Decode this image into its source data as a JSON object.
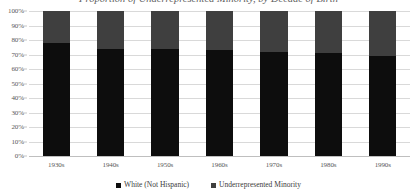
{
  "chart_data": {
    "type": "bar",
    "subtype": "stacked-100-percent",
    "title": "Proportion of Underrepresented Minority, by Decade of Birth",
    "title_visible": false,
    "xlabel": "",
    "ylabel": "",
    "categories": [
      "1930s",
      "1940s",
      "1950s",
      "1960s",
      "1970s",
      "1980s",
      "1990s"
    ],
    "series": [
      {
        "name": "White (Not Hispanic)",
        "color": "#0d0d0d",
        "values": [
          78,
          74,
          74,
          73,
          72,
          71,
          69
        ]
      },
      {
        "name": "Underrepresented Minority",
        "color": "#3f3f3f",
        "values": [
          22,
          26,
          26,
          27,
          28,
          29,
          31
        ]
      }
    ],
    "ylim": [
      0,
      100
    ],
    "ytick_labels": [
      "0%",
      "10%",
      "20%",
      "30%",
      "40%",
      "50%",
      "60%",
      "70%",
      "80%",
      "90%",
      "100%"
    ],
    "ytick_values": [
      0,
      10,
      20,
      30,
      40,
      50,
      60,
      70,
      80,
      90,
      100
    ],
    "grid": true,
    "legend_position": "bottom"
  },
  "legend": {
    "items": [
      {
        "label": "White (Not Hispanic)",
        "color": "#0d0d0d",
        "marker": "square-marker"
      },
      {
        "label": "Underrepresented Minority",
        "color": "#3f3f3f",
        "marker": "square-marker"
      }
    ]
  }
}
